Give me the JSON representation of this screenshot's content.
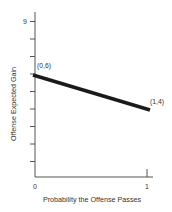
{
  "chart_data": {
    "type": "line",
    "title": "",
    "xlabel": "Probability the Offense Passes",
    "ylabel": "Offense Expected Gain",
    "x": [
      0,
      1
    ],
    "series": [
      {
        "name": "Offense Expected Gain",
        "values": [
          6,
          4
        ],
        "color": "#1a1a1a"
      }
    ],
    "annotations": [
      {
        "text": "(0,6)",
        "x": 0,
        "y": 6
      },
      {
        "text": "(1,4)",
        "x": 1,
        "y": 4
      }
    ],
    "xlim": [
      0,
      1
    ],
    "ylim": [
      0,
      9
    ],
    "x_tick_labels": [
      "0",
      "1"
    ],
    "y_tick_labels_shown": [
      "9"
    ],
    "y_ticks": [
      1,
      2,
      3,
      4,
      5,
      6,
      7,
      8,
      9
    ],
    "grid": false,
    "legend": "none"
  },
  "labels": {
    "xlabel": "Probability the Offense Passes",
    "ylabel": "Offense Expected Gain",
    "x0": "0",
    "x1": "1",
    "y9": "9",
    "p0": "(0,6)",
    "p1": "(1,4)"
  },
  "colors": {
    "axis": "#555555",
    "line": "#1a1a1a",
    "text": "#333333"
  }
}
